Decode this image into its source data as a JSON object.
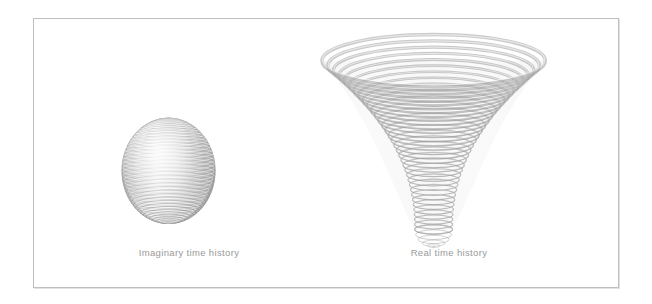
{
  "figure": {
    "background_color": "#ffffff",
    "frame": {
      "border_color": "#bfbfbf",
      "shadow_color": "#e3e3e3",
      "x": 33,
      "y": 18,
      "width": 586,
      "height": 270
    },
    "ink_color_light": "#d9d9d9",
    "ink_color_mid": "#b4b4b4",
    "ink_color_dark": "#8e8e8e",
    "caption_color": "#9a9a9a"
  },
  "panels": [
    {
      "id": "imaginary-time",
      "caption": "Imaginary time history",
      "shape": "sphere",
      "center_x": 135,
      "center_y": 153,
      "radius_x": 47,
      "radius_y": 53,
      "ring_count": 44,
      "description": "Closed spherical surface drawn as stacked latitude rings"
    },
    {
      "id": "real-time",
      "caption": "Real time history",
      "shape": "trumpet-funnel",
      "center_x": 401,
      "top_y": 42,
      "bottom_y": 212,
      "top_radius_x": 112,
      "bottom_radius_x": 19,
      "ellipse_flatten": 0.235,
      "ring_count": 34,
      "description": "Flaring trumpet / funnel surface drawn as stacked circles of increasing radius"
    }
  ]
}
